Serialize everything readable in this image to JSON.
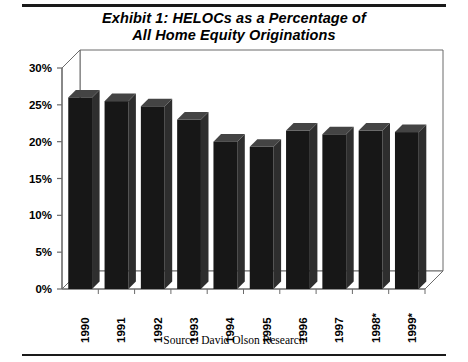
{
  "document": {
    "title_line1": "Exhibit 1: HELOCs as a Percentage of",
    "title_line2": "All Home Equity Originations",
    "source_note": "Source: David Olson Research"
  },
  "axis": {
    "y_ticks": [
      "0%",
      "5%",
      "10%",
      "15%",
      "20%",
      "25%",
      "30%"
    ],
    "x_ticks": [
      "1990",
      "1991",
      "1992",
      "1993",
      "1994",
      "1995",
      "1996",
      "1997",
      "1998*",
      "1999*"
    ]
  },
  "colors": {
    "bar_front": "#171717",
    "bar_side": "#2e2e2e",
    "bar_top": "#444444",
    "axis": "#6b6b6b",
    "rule": "#1a1a1a",
    "text": "#000000",
    "background": "#ffffff"
  },
  "chart_data": {
    "type": "bar",
    "title": "Exhibit 1: HELOCs as a Percentage of All Home Equity Originations",
    "xlabel": "",
    "ylabel": "",
    "ylim": [
      0,
      30
    ],
    "ytick_step": 5,
    "yunit": "%",
    "grid": false,
    "legend": "none",
    "three_d": true,
    "categories": [
      "1990",
      "1991",
      "1992",
      "1993",
      "1994",
      "1995",
      "1996",
      "1997",
      "1998*",
      "1999*"
    ],
    "values": [
      26.0,
      25.5,
      24.8,
      23.0,
      20.0,
      19.3,
      21.5,
      21.0,
      21.5,
      21.3
    ],
    "annotations": [
      "1998 and 1999 values are estimates, denoted by asterisk"
    ],
    "source": "David Olson Research"
  }
}
